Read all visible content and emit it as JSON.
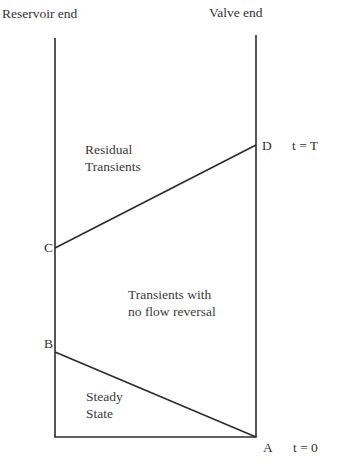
{
  "diagram": {
    "type": "time-space transient diagram",
    "axes": {
      "left_label": "Reservoir end",
      "right_label": "Valve end"
    },
    "points": {
      "A": {
        "label": "A",
        "time_label": "t = 0"
      },
      "B": {
        "label": "B"
      },
      "C": {
        "label": "C"
      },
      "D": {
        "label": "D",
        "time_label": "t = T"
      }
    },
    "regions": {
      "steady_state": "Steady\nState",
      "no_flow_reversal": "Transients with\nno flow reversal",
      "residual": "Residual\nTransients"
    },
    "lines": [
      {
        "from": "A",
        "to": "B"
      },
      {
        "from": "C",
        "to": "D"
      }
    ],
    "colors": {
      "line": "#2b2b2b",
      "text": "#333333",
      "background": "#ffffff"
    },
    "caption_fragment": "(partially visible, illegible)"
  }
}
